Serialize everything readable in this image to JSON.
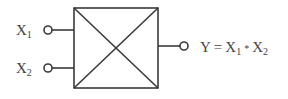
{
  "diagram": {
    "type": "block",
    "block": {
      "symbol": "box-with-x",
      "label": ""
    },
    "inputs": [
      {
        "id": "x1",
        "name": "X",
        "subscript": "1"
      },
      {
        "id": "x2",
        "name": "X",
        "subscript": "2"
      }
    ],
    "output": {
      "id": "y",
      "lhs": "Y",
      "equals": "=",
      "term1": {
        "name": "X",
        "subscript": "1"
      },
      "operator": "*",
      "term2": {
        "name": "X",
        "subscript": "2"
      }
    },
    "colors": {
      "stroke": "#3a3a3a",
      "text": "#444444",
      "background": "#ffffff"
    }
  }
}
